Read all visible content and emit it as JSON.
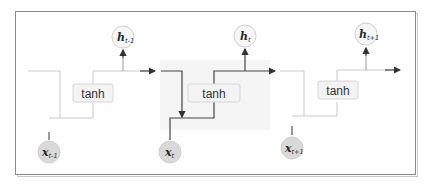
{
  "diagram": {
    "type": "unrolled-rnn",
    "colors": {
      "frame": "#8a8a8a",
      "faint_line": "#c9c9c9",
      "dark_line": "#444444",
      "tanh_box_fill": "#f3f3f3",
      "input_circle_fill": "#d9d9d9",
      "output_circle_fill": "#f6f6f6"
    },
    "cells": [
      {
        "activation": "tanh",
        "output": {
          "var": "h",
          "sub": "t-1"
        },
        "input": {
          "var": "x",
          "sub": "t-1"
        },
        "highlighted": false
      },
      {
        "activation": "tanh",
        "output": {
          "var": "h",
          "sub": "t"
        },
        "input": {
          "var": "x",
          "sub": "t"
        },
        "highlighted": true
      },
      {
        "activation": "tanh",
        "output": {
          "var": "h",
          "sub": "t+1"
        },
        "input": {
          "var": "x",
          "sub": "t+1"
        },
        "highlighted": false
      }
    ]
  }
}
